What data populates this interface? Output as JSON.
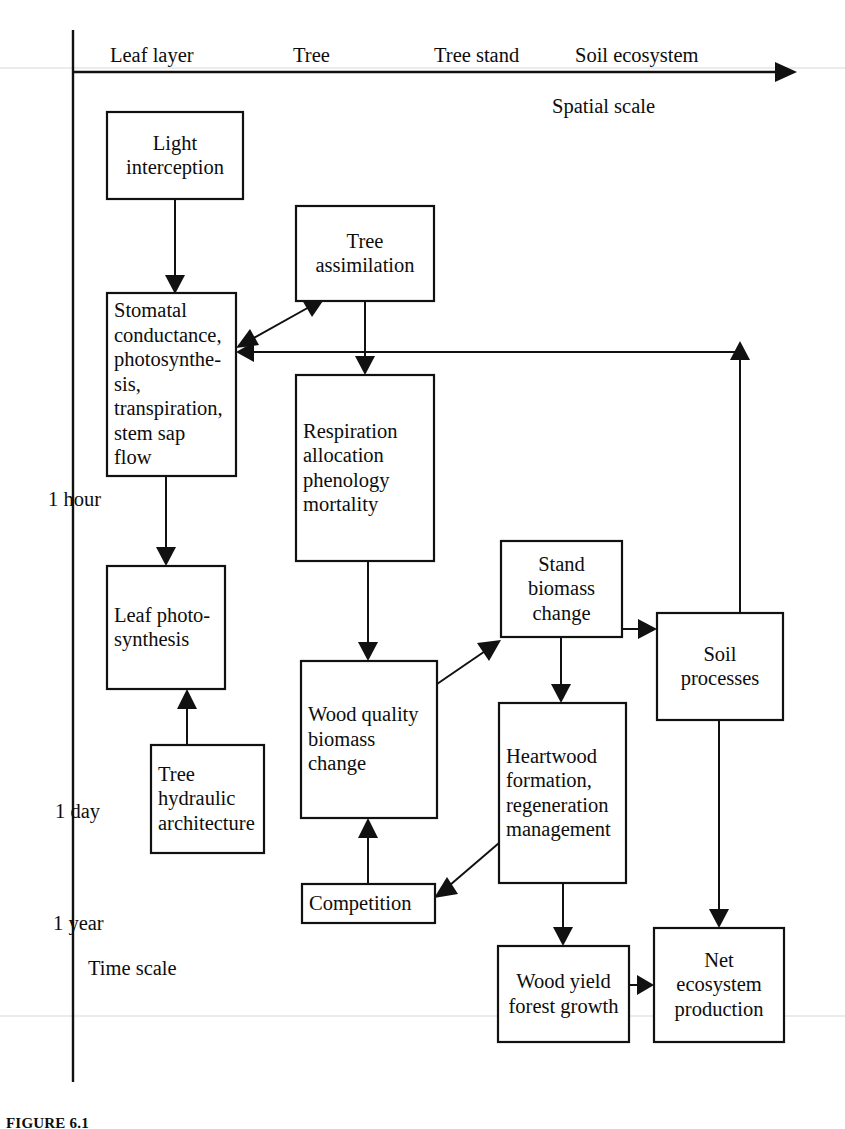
{
  "figure": {
    "caption": "FIGURE 6.1",
    "spatial_axis_title": "Spatial scale",
    "time_axis_title": "Time scale"
  },
  "spatial_scale_labels": [
    {
      "id": "leaf-layer",
      "label": "Leaf layer",
      "x": 110,
      "y": 62
    },
    {
      "id": "tree",
      "label": "Tree",
      "x": 293,
      "y": 62
    },
    {
      "id": "tree-stand",
      "label": "Tree stand",
      "x": 434,
      "y": 62
    },
    {
      "id": "soil-ecosystem",
      "label": "Soil ecosystem",
      "x": 575,
      "y": 62
    }
  ],
  "time_scale_labels": [
    {
      "id": "one-hour",
      "label": "1 hour",
      "x": 48,
      "y": 506
    },
    {
      "id": "one-day",
      "label": "1 day",
      "x": 55,
      "y": 818
    },
    {
      "id": "one-year",
      "label": "1 year",
      "x": 53,
      "y": 930
    }
  ],
  "axis_titles": {
    "spatial": {
      "label": "Spatial scale",
      "x": 552,
      "y": 113
    },
    "time": {
      "label": "Time scale",
      "x": 88,
      "y": 975
    }
  },
  "boxes": [
    {
      "id": "light-interception",
      "x": 107,
      "y": 112,
      "w": 136,
      "h": 87,
      "align": "center",
      "lines": [
        "Light",
        "interception"
      ]
    },
    {
      "id": "stomatal-conductance",
      "x": 107,
      "y": 293,
      "w": 129,
      "h": 183,
      "align": "left",
      "lines": [
        "Stomatal",
        "conductance,",
        "photosynthe-",
        "sis,",
        "transpiration,",
        "stem sap",
        "flow"
      ]
    },
    {
      "id": "leaf-photosynthesis",
      "x": 107,
      "y": 566,
      "w": 118,
      "h": 123,
      "align": "left",
      "lines": [
        "Leaf photo-",
        "synthesis"
      ]
    },
    {
      "id": "tree-hydraulic-architecture",
      "x": 151,
      "y": 745,
      "w": 113,
      "h": 108,
      "align": "left",
      "lines": [
        "Tree",
        "hydraulic",
        "architecture"
      ]
    },
    {
      "id": "tree-assimilation",
      "x": 296,
      "y": 206,
      "w": 138,
      "h": 95,
      "align": "center",
      "lines": [
        "Tree",
        "assimilation"
      ]
    },
    {
      "id": "respiration-allocation",
      "x": 296,
      "y": 375,
      "w": 138,
      "h": 186,
      "align": "left",
      "lines": [
        "Respiration",
        "allocation",
        "phenology",
        "mortality"
      ]
    },
    {
      "id": "wood-quality-biomass-change",
      "x": 301,
      "y": 661,
      "w": 136,
      "h": 157,
      "align": "left",
      "lines": [
        "Wood quality",
        "biomass",
        "change"
      ]
    },
    {
      "id": "competition",
      "x": 302,
      "y": 884,
      "w": 133,
      "h": 39,
      "align": "left",
      "lines": [
        "Competition"
      ]
    },
    {
      "id": "stand-biomass-change",
      "x": 501,
      "y": 541,
      "w": 121,
      "h": 96,
      "align": "center",
      "lines": [
        "Stand",
        "biomass",
        "change"
      ]
    },
    {
      "id": "heartwood-formation",
      "x": 499,
      "y": 703,
      "w": 127,
      "h": 180,
      "align": "left",
      "lines": [
        "Heartwood",
        "formation,",
        "regeneration",
        "management"
      ]
    },
    {
      "id": "soil-processes",
      "x": 657,
      "y": 613,
      "w": 126,
      "h": 107,
      "align": "center",
      "lines": [
        "Soil",
        "processes"
      ]
    },
    {
      "id": "wood-yield-forest-growth",
      "x": 498,
      "y": 946,
      "w": 131,
      "h": 96,
      "align": "center",
      "lines": [
        "Wood yield",
        "forest growth"
      ]
    },
    {
      "id": "net-ecosystem-production",
      "x": 654,
      "y": 928,
      "w": 130,
      "h": 114,
      "align": "center",
      "lines": [
        "Net",
        "ecosystem",
        "production"
      ]
    }
  ],
  "connections": [
    {
      "id": "light-to-stomatal",
      "from": "light-interception",
      "to": "stomatal-conductance"
    },
    {
      "id": "stomatal-to-leafphoto",
      "from": "stomatal-conductance",
      "to": "leaf-photosynthesis"
    },
    {
      "id": "hydraulic-to-leafphoto",
      "from": "tree-hydraulic-architecture",
      "to": "leaf-photosynthesis"
    },
    {
      "id": "stomatal-treeassim-bidir",
      "from": "stomatal-conductance",
      "to": "tree-assimilation",
      "bidirectional": true
    },
    {
      "id": "treeassim-to-respiration",
      "from": "tree-assimilation",
      "to": "respiration-allocation"
    },
    {
      "id": "respiration-to-woodquality",
      "from": "respiration-allocation",
      "to": "wood-quality-biomass-change"
    },
    {
      "id": "woodquality-to-standbiomass",
      "from": "wood-quality-biomass-change",
      "to": "stand-biomass-change"
    },
    {
      "id": "competition-to-woodquality",
      "from": "competition",
      "to": "wood-quality-biomass-change"
    },
    {
      "id": "standbiomass-to-soil",
      "from": "stand-biomass-change",
      "to": "soil-processes"
    },
    {
      "id": "standbiomass-to-heartwood",
      "from": "stand-biomass-change",
      "to": "heartwood-formation"
    },
    {
      "id": "heartwood-to-competition",
      "from": "heartwood-formation",
      "to": "competition"
    },
    {
      "id": "heartwood-to-woodyield",
      "from": "heartwood-formation",
      "to": "wood-yield-forest-growth"
    },
    {
      "id": "soil-to-netecosystem",
      "from": "soil-processes",
      "to": "net-ecosystem-production"
    },
    {
      "id": "woodyield-to-netecosystem",
      "from": "wood-yield-forest-growth",
      "to": "net-ecosystem-production"
    },
    {
      "id": "soil-to-stomatal-feedback",
      "from": "soil-processes",
      "to": "stomatal-conductance"
    }
  ]
}
